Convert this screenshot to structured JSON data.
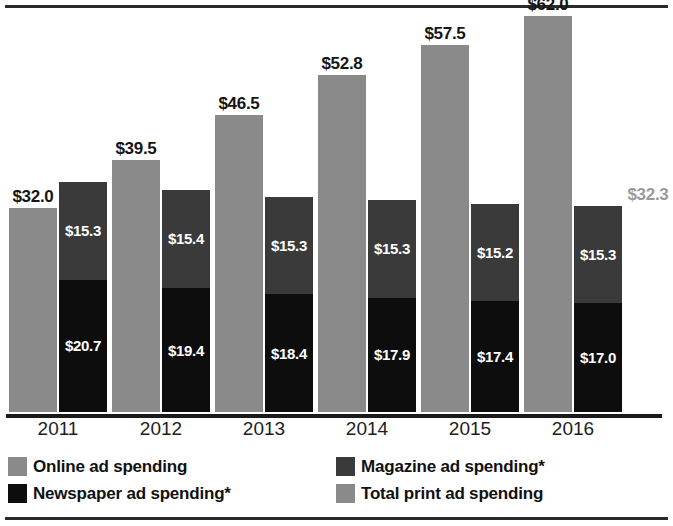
{
  "chart_data": {
    "type": "bar",
    "subtype": "grouped-stacked",
    "title": "",
    "subtitle": "",
    "xlabel": "",
    "ylabel": "",
    "grid": false,
    "axis_visible": true,
    "value_prefix": "$",
    "ylim": [
      0,
      62
    ],
    "legend_position": "bottom",
    "categories": [
      "2011",
      "2012",
      "2013",
      "2014",
      "2015",
      "2016"
    ],
    "series": [
      {
        "name": "Online ad spending",
        "color": "#8a8a8a",
        "group": "online",
        "values": [
          32.0,
          39.5,
          46.5,
          52.8,
          57.5,
          62.0
        ],
        "labels": [
          "$32.0",
          "$39.5",
          "$46.5",
          "$52.8",
          "$57.5",
          "$62.0"
        ],
        "label_color": "#151515"
      },
      {
        "name": "Magazine ad spending*",
        "color": "#3a3a3a",
        "group": "print",
        "stack_position": "top",
        "values": [
          15.3,
          15.4,
          15.3,
          15.3,
          15.2,
          15.3
        ],
        "labels": [
          "$15.3",
          "$15.4",
          "$15.3",
          "$15.3",
          "$15.2",
          "$15.3"
        ],
        "label_color": "#ffffff"
      },
      {
        "name": "Newspaper ad spending*",
        "color": "#0d0d0d",
        "group": "print",
        "stack_position": "bottom",
        "values": [
          20.7,
          19.4,
          18.4,
          17.9,
          17.4,
          17.0
        ],
        "labels": [
          "$20.7",
          "$19.4",
          "$18.4",
          "$17.9",
          "$17.4",
          "$17.0"
        ],
        "label_color": "#ffffff"
      },
      {
        "name": "Total print ad spending",
        "color": "#8a8a8a",
        "group": "print",
        "role": "stack-total",
        "values": [
          36.0,
          33.8,
          33.8,
          33.1,
          32.6,
          32.3
        ],
        "labels": [
          "$36.0",
          "$33.8",
          "$33.8",
          "$33.1",
          "$32.6",
          "$32.3"
        ],
        "label_color": "#9a9a9a"
      }
    ],
    "legend": [
      {
        "label": "Online ad spending",
        "color": "#8a8a8a"
      },
      {
        "label": "Newspaper ad spending*",
        "color": "#0d0d0d"
      },
      {
        "label": "Magazine ad spending*",
        "color": "#3a3a3a"
      },
      {
        "label": "Total print ad spending",
        "color": "#8a8a8a"
      }
    ]
  },
  "colors": {
    "online": "#8a8a8a",
    "magazine": "#3a3a3a",
    "newspaper": "#0d0d0d",
    "total_print": "#8a8a8a",
    "rule": "#2b2b2b",
    "axis": "#1a1a1a",
    "background": "#ffffff"
  }
}
